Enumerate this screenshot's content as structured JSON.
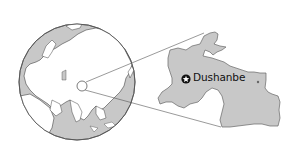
{
  "map": {
    "type": "locator-map",
    "globe": {
      "region_centered": "Asia",
      "ocean_color": "#c8c8c8",
      "land_color": "#ffffff",
      "outline_color": "#555555",
      "locator_circle": {
        "cx": 82,
        "cy": 86,
        "r": 5
      }
    },
    "inset": {
      "country": "Tajikistan",
      "fill_color": "#c8c8c8",
      "outline_color": "#666666"
    },
    "capital": {
      "name": "Dushanbe",
      "marker_icon": "capital-star-circle-icon"
    },
    "secondary_city_marker": "city-dot-icon"
  }
}
